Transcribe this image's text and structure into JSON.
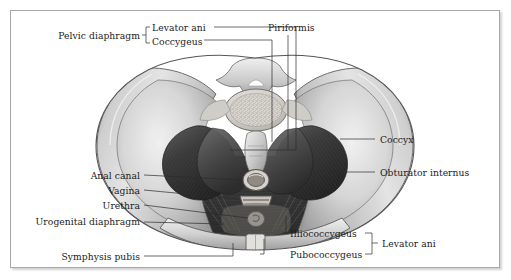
{
  "figure": {
    "background_color": "#ffffff",
    "frame_border_color": "#a8a8a8",
    "leader_color": "#2b2b2b",
    "label_color": "#1b1b1b"
  },
  "labels": {
    "pelvic_diaphragm": "Pelvic diaphragm",
    "levator_ani_top": "Levator ani",
    "coccygeus": "Coccygeus",
    "piriformis": "Piriformis",
    "coccyx": "Coccyx",
    "obturator_internus": "Obturator internus",
    "anal_canal": "Anal canal",
    "vagina": "Vagina",
    "urethra": "Urethra",
    "urogenital_diaphragm": "Urogenital diaphragm",
    "symphysis_pubis": "Symphysis pubis",
    "illiococcygeus": "Illiococcygeus",
    "pubococcygeus": "Pubococcygeus",
    "levator_ani_bottom": "Levator ani"
  },
  "brackets": {
    "pelvic_diaphragm_group": [
      "Levator ani",
      "Coccygeus"
    ],
    "levator_ani_group": [
      "Illiococcygeus",
      "Pubococcygeus"
    ]
  },
  "structures": {
    "sacrum": "sacral-vertebra",
    "ilium_left": "left-iliac-wing",
    "ilium_right": "right-iliac-wing",
    "piriformis_left": "left-piriformis-muscle",
    "piriformis_right": "right-piriformis-muscle",
    "coccygeus_left": "left-coccygeus-muscle",
    "coccygeus_right": "right-coccygeus-muscle",
    "levator_ani_sheet": "levator-ani-muscle-sheet",
    "anal_canal_opening": "anal-canal-orifice",
    "vaginal_opening": "vaginal-orifice",
    "urethral_opening": "urethral-orifice",
    "symphysis": "symphysis-pubis-joint"
  }
}
